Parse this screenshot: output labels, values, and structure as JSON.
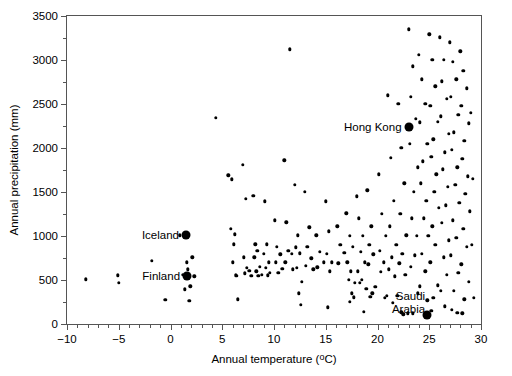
{
  "chart_data": {
    "type": "scatter",
    "title": "",
    "xlabel": "Annual temperature (ºC)",
    "ylabel": "Annual precipitation (mm)",
    "xlim": [
      -10,
      30
    ],
    "ylim": [
      0,
      3500
    ],
    "xticks": [
      -10,
      -5,
      0,
      5,
      10,
      15,
      20,
      25,
      30
    ],
    "yticks": [
      0,
      500,
      1000,
      1500,
      2000,
      2500,
      3000,
      3500
    ],
    "x_minor_step": 1,
    "y_minor_step": 250,
    "grid": false,
    "legend": null,
    "marker": "filled-circle",
    "marker_color": "#000000",
    "series": [
      {
        "name": "World cities",
        "points": [
          [
            -8.2,
            510
          ],
          [
            -5.1,
            555
          ],
          [
            -5.0,
            470
          ],
          [
            -1.8,
            720
          ],
          [
            -0.5,
            275
          ],
          [
            0.9,
            1010
          ],
          [
            1.2,
            560
          ],
          [
            1.6,
            700
          ],
          [
            1.7,
            620
          ],
          [
            1.5,
            525
          ],
          [
            1.9,
            430
          ],
          [
            1.4,
            395
          ],
          [
            1.8,
            265
          ],
          [
            2.1,
            760
          ],
          [
            2.3,
            540
          ],
          [
            4.4,
            2340
          ],
          [
            5.6,
            1690
          ],
          [
            5.9,
            1645
          ],
          [
            5.8,
            1080
          ],
          [
            6.1,
            905
          ],
          [
            6.0,
            700
          ],
          [
            6.3,
            555
          ],
          [
            6.4,
            550
          ],
          [
            6.5,
            280
          ],
          [
            6.2,
            1020
          ],
          [
            7.0,
            1810
          ],
          [
            7.3,
            1420
          ],
          [
            7.1,
            760
          ],
          [
            7.4,
            640
          ],
          [
            7.6,
            605
          ],
          [
            7.2,
            575
          ],
          [
            7.8,
            545
          ],
          [
            8.0,
            1455
          ],
          [
            8.2,
            905
          ],
          [
            8.4,
            830
          ],
          [
            8.1,
            760
          ],
          [
            8.6,
            650
          ],
          [
            8.3,
            600
          ],
          [
            8.8,
            560
          ],
          [
            8.5,
            545
          ],
          [
            9.1,
            1395
          ],
          [
            9.3,
            905
          ],
          [
            9.0,
            800
          ],
          [
            9.5,
            700
          ],
          [
            9.2,
            640
          ],
          [
            9.6,
            580
          ],
          [
            9.4,
            555
          ],
          [
            10.1,
            1180
          ],
          [
            10.3,
            880
          ],
          [
            10.6,
            790
          ],
          [
            10.2,
            700
          ],
          [
            10.8,
            625
          ],
          [
            10.4,
            580
          ],
          [
            11.0,
            1860
          ],
          [
            11.2,
            1155
          ],
          [
            11.5,
            3120
          ],
          [
            11.4,
            830
          ],
          [
            11.7,
            800
          ],
          [
            11.1,
            700
          ],
          [
            11.8,
            620
          ],
          [
            12.0,
            1580
          ],
          [
            12.3,
            1010
          ],
          [
            12.1,
            870
          ],
          [
            12.5,
            805
          ],
          [
            12.2,
            640
          ],
          [
            12.7,
            480
          ],
          [
            12.4,
            350
          ],
          [
            12.6,
            215
          ],
          [
            13.0,
            1500
          ],
          [
            13.4,
            1100
          ],
          [
            13.2,
            880
          ],
          [
            13.6,
            745
          ],
          [
            13.1,
            660
          ],
          [
            13.8,
            620
          ],
          [
            14.1,
            1010
          ],
          [
            14.4,
            820
          ],
          [
            14.8,
            700
          ],
          [
            14.2,
            645
          ],
          [
            15.0,
            1395
          ],
          [
            15.3,
            1055
          ],
          [
            15.1,
            800
          ],
          [
            15.6,
            700
          ],
          [
            15.4,
            600
          ],
          [
            15.2,
            190
          ],
          [
            16.1,
            1110
          ],
          [
            16.4,
            900
          ],
          [
            16.8,
            810
          ],
          [
            16.2,
            690
          ],
          [
            17.0,
            1260
          ],
          [
            17.3,
            1000
          ],
          [
            17.6,
            880
          ],
          [
            17.1,
            700
          ],
          [
            17.4,
            600
          ],
          [
            17.2,
            500
          ],
          [
            17.8,
            465
          ],
          [
            17.5,
            350
          ],
          [
            17.7,
            305
          ],
          [
            17.3,
            250
          ],
          [
            18.0,
            1450
          ],
          [
            18.2,
            1200
          ],
          [
            18.6,
            1000
          ],
          [
            18.4,
            820
          ],
          [
            18.8,
            700
          ],
          [
            18.1,
            600
          ],
          [
            18.5,
            500
          ],
          [
            18.3,
            470
          ],
          [
            18.9,
            400
          ],
          [
            18.7,
            140
          ],
          [
            19.0,
            1520
          ],
          [
            19.4,
            1110
          ],
          [
            19.2,
            900
          ],
          [
            19.6,
            790
          ],
          [
            19.1,
            680
          ],
          [
            19.8,
            420
          ],
          [
            19.5,
            350
          ],
          [
            19.3,
            310
          ],
          [
            20.1,
            1700
          ],
          [
            20.4,
            1250
          ],
          [
            20.8,
            1000
          ],
          [
            20.2,
            830
          ],
          [
            20.6,
            700
          ],
          [
            20.3,
            590
          ],
          [
            20.9,
            320
          ],
          [
            20.7,
            300
          ],
          [
            21.0,
            2600
          ],
          [
            21.3,
            1890
          ],
          [
            21.6,
            1400
          ],
          [
            21.2,
            1110
          ],
          [
            21.8,
            900
          ],
          [
            21.4,
            760
          ],
          [
            21.1,
            620
          ],
          [
            21.7,
            540
          ],
          [
            21.9,
            320
          ],
          [
            21.5,
            240
          ],
          [
            22.0,
            2500
          ],
          [
            22.3,
            2000
          ],
          [
            22.6,
            1600
          ],
          [
            22.2,
            1250
          ],
          [
            22.8,
            1010
          ],
          [
            22.4,
            800
          ],
          [
            22.1,
            690
          ],
          [
            22.7,
            560
          ],
          [
            22.9,
            120
          ],
          [
            22.5,
            110
          ],
          [
            22.3,
            135
          ],
          [
            23.0,
            3350
          ],
          [
            23.4,
            2930
          ],
          [
            23.2,
            2580
          ],
          [
            23.7,
            2330
          ],
          [
            23.1,
            2050
          ],
          [
            23.9,
            1780
          ],
          [
            23.5,
            1500
          ],
          [
            23.3,
            1200
          ],
          [
            23.8,
            1000
          ],
          [
            23.6,
            780
          ],
          [
            23.2,
            650
          ],
          [
            23.9,
            350
          ],
          [
            23.4,
            120
          ],
          [
            24.0,
            3060
          ],
          [
            24.3,
            2780
          ],
          [
            24.6,
            2500
          ],
          [
            24.1,
            2290
          ],
          [
            24.8,
            2050
          ],
          [
            24.4,
            1850
          ],
          [
            24.2,
            1600
          ],
          [
            24.7,
            1400
          ],
          [
            24.5,
            1200
          ],
          [
            24.9,
            1000
          ],
          [
            24.3,
            800
          ],
          [
            24.6,
            600
          ],
          [
            24.1,
            430
          ],
          [
            24.8,
            270
          ],
          [
            25.0,
            3290
          ],
          [
            25.3,
            3000
          ],
          [
            25.6,
            2700
          ],
          [
            25.1,
            2480
          ],
          [
            25.8,
            2300
          ],
          [
            25.4,
            2100
          ],
          [
            25.2,
            1900
          ],
          [
            25.7,
            1700
          ],
          [
            25.5,
            1500
          ],
          [
            25.9,
            1320
          ],
          [
            25.3,
            1110
          ],
          [
            25.6,
            900
          ],
          [
            25.1,
            700
          ],
          [
            25.8,
            440
          ],
          [
            25.4,
            300
          ],
          [
            25.2,
            150
          ],
          [
            26.0,
            3260
          ],
          [
            26.4,
            3000
          ],
          [
            26.2,
            2760
          ],
          [
            26.7,
            2560
          ],
          [
            26.1,
            2360
          ],
          [
            26.9,
            2160
          ],
          [
            26.5,
            1950
          ],
          [
            26.3,
            1760
          ],
          [
            26.8,
            1560
          ],
          [
            26.6,
            1350
          ],
          [
            26.2,
            1150
          ],
          [
            26.9,
            950
          ],
          [
            26.4,
            760
          ],
          [
            26.7,
            560
          ],
          [
            26.1,
            380
          ],
          [
            26.5,
            200
          ],
          [
            27.0,
            3200
          ],
          [
            27.3,
            2980
          ],
          [
            27.6,
            2780
          ],
          [
            27.1,
            2580
          ],
          [
            27.8,
            2380
          ],
          [
            27.4,
            2180
          ],
          [
            27.2,
            1980
          ],
          [
            27.7,
            1780
          ],
          [
            27.5,
            1580
          ],
          [
            27.9,
            1380
          ],
          [
            27.3,
            1180
          ],
          [
            27.6,
            980
          ],
          [
            27.1,
            780
          ],
          [
            27.8,
            580
          ],
          [
            27.4,
            380
          ],
          [
            27.2,
            160
          ],
          [
            27.7,
            130
          ],
          [
            28.0,
            3100
          ],
          [
            28.3,
            2880
          ],
          [
            28.6,
            2680
          ],
          [
            28.1,
            2480
          ],
          [
            28.8,
            2280
          ],
          [
            28.4,
            2080
          ],
          [
            28.2,
            1880
          ],
          [
            28.7,
            1680
          ],
          [
            28.5,
            1480
          ],
          [
            28.9,
            1280
          ],
          [
            28.3,
            1080
          ],
          [
            28.6,
            880
          ],
          [
            28.1,
            680
          ],
          [
            28.8,
            480
          ],
          [
            28.4,
            280
          ],
          [
            28.2,
            120
          ],
          [
            29.0,
            2400
          ],
          [
            29.2,
            1650
          ],
          [
            29.1,
            900
          ],
          [
            29.3,
            300
          ]
        ]
      }
    ],
    "highlighted_points": [
      {
        "label": "Iceland",
        "x": 1.5,
        "y": 1010,
        "label_position": "left"
      },
      {
        "label": "Finland",
        "x": 1.6,
        "y": 540,
        "label_position": "left"
      },
      {
        "label": "Hong Kong",
        "x": 23.0,
        "y": 2240,
        "label_position": "left"
      },
      {
        "label": "Saudi Arabia",
        "x": 24.8,
        "y": 100,
        "label_position": "left"
      }
    ]
  }
}
